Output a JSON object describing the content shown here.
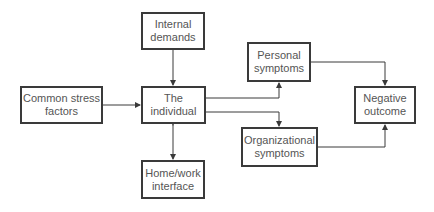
{
  "diagram": {
    "nodes": {
      "internal_demands": "Internal\ndemands",
      "common_stress": "Common stress\nfactors",
      "individual": "The\nindividual",
      "home_work": "Home/work\ninterface",
      "personal_symptoms": "Personal\nsymptoms",
      "organizational_symptoms": "Organizational\nsymptoms",
      "negative_outcome": "Negative\noutcome"
    },
    "edges": [
      {
        "from": "internal_demands",
        "to": "individual",
        "type": "arrow"
      },
      {
        "from": "common_stress",
        "to": "individual",
        "type": "arrow"
      },
      {
        "from": "individual",
        "to": "home_work",
        "type": "bidirectional"
      },
      {
        "from": "individual",
        "to": "personal_symptoms",
        "type": "arrow"
      },
      {
        "from": "individual",
        "to": "organizational_symptoms",
        "type": "arrow"
      },
      {
        "from": "personal_symptoms",
        "to": "negative_outcome",
        "type": "arrow"
      },
      {
        "from": "organizational_symptoms",
        "to": "negative_outcome",
        "type": "arrow"
      }
    ],
    "colors": {
      "line": "#3a3a3a",
      "text": "#555555"
    }
  }
}
